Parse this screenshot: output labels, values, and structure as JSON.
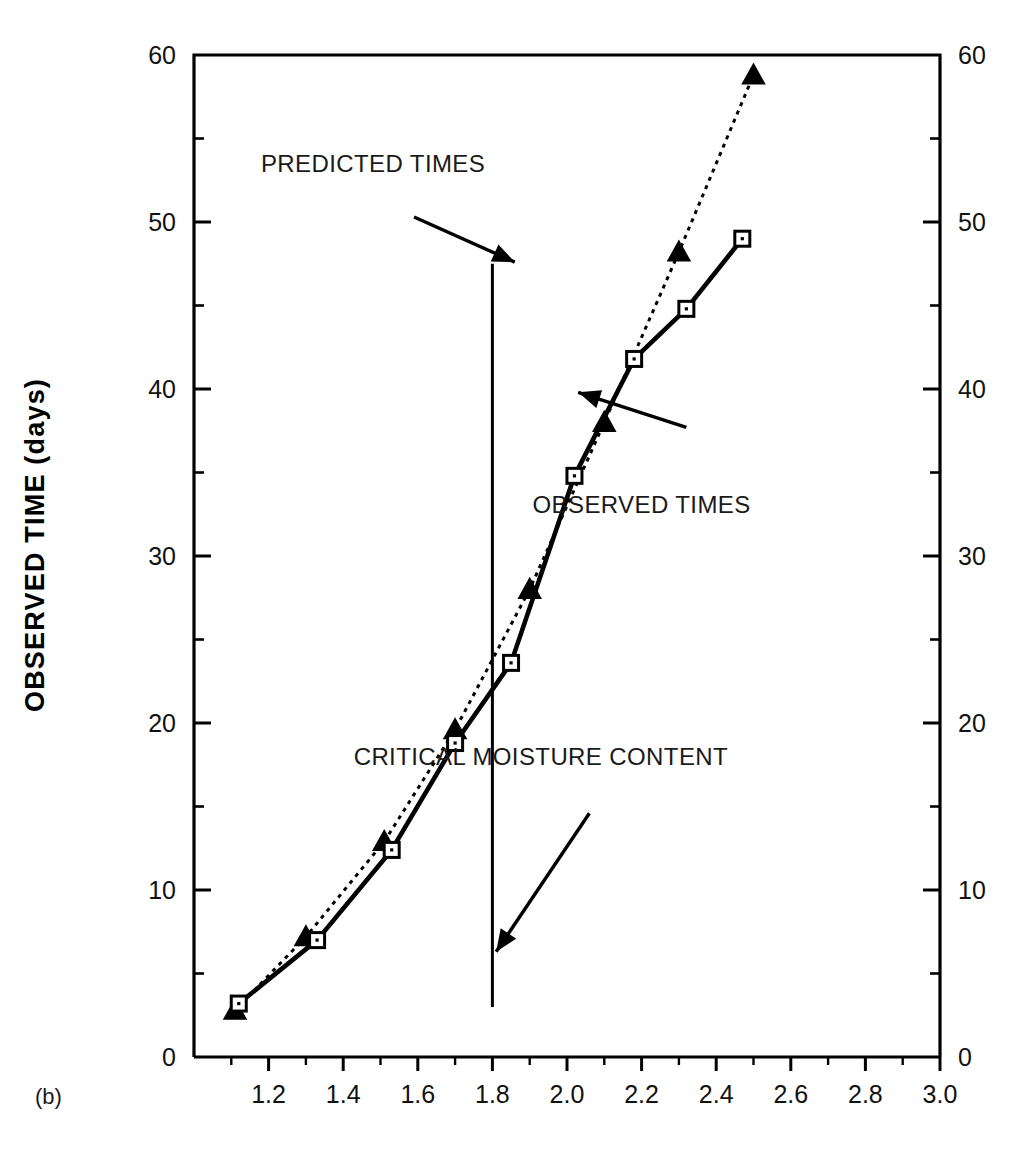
{
  "figure": {
    "panel_label": "(b)",
    "background_color": "#ffffff",
    "ink_color": "#000000"
  },
  "chart_data": {
    "type": "line",
    "title": "",
    "xlabel": "",
    "ylabel": "OBSERVED TIME (days)",
    "xlim": [
      1.0,
      3.0
    ],
    "ylim": [
      0,
      60
    ],
    "x_major_ticks": [
      1.2,
      1.4,
      1.6,
      1.8,
      2.0,
      2.2,
      2.4,
      2.6,
      2.8,
      3.0
    ],
    "x_major_tick_labels": [
      "1.2",
      "1.4",
      "1.6",
      "1.8",
      "2.0",
      "2.2",
      "2.4",
      "2.6",
      "2.8",
      "3.0"
    ],
    "x_minor_ticks": [
      1.1,
      1.3,
      1.5,
      1.7,
      1.9,
      2.1,
      2.3,
      2.5,
      2.7,
      2.9
    ],
    "y_major_ticks": [
      0,
      10,
      20,
      30,
      40,
      50,
      60
    ],
    "y_major_tick_labels": [
      "0",
      "10",
      "20",
      "30",
      "40",
      "50",
      "60"
    ],
    "y_minor_ticks": [
      5,
      15,
      25,
      35,
      45,
      55
    ],
    "grid": false,
    "legend_position": "none",
    "left_axis_labels": [
      "60",
      "50",
      "40",
      "30",
      "20",
      "10",
      "0"
    ],
    "right_axis_labels": [
      "60",
      "50",
      "40",
      "30",
      "20",
      "10",
      "0"
    ],
    "series": [
      {
        "name": "PREDICTED TIMES",
        "marker": "filled-triangle",
        "linestyle": "dotted",
        "color": "#000000",
        "points": [
          {
            "x": 1.11,
            "y": 2.8
          },
          {
            "x": 1.3,
            "y": 7.2
          },
          {
            "x": 1.51,
            "y": 12.9
          },
          {
            "x": 1.7,
            "y": 19.6
          },
          {
            "x": 1.9,
            "y": 28.0
          },
          {
            "x": 2.1,
            "y": 38.0
          },
          {
            "x": 2.3,
            "y": 48.2
          },
          {
            "x": 2.5,
            "y": 58.8
          }
        ]
      },
      {
        "name": "OBSERVED TIMES",
        "marker": "open-square",
        "linestyle": "solid",
        "color": "#000000",
        "points": [
          {
            "x": 1.12,
            "y": 3.2
          },
          {
            "x": 1.33,
            "y": 7.0
          },
          {
            "x": 1.53,
            "y": 12.4
          },
          {
            "x": 1.7,
            "y": 18.8
          },
          {
            "x": 1.85,
            "y": 23.6
          },
          {
            "x": 2.02,
            "y": 34.8
          },
          {
            "x": 2.18,
            "y": 41.8
          },
          {
            "x": 2.32,
            "y": 44.8
          },
          {
            "x": 2.47,
            "y": 49.0
          }
        ]
      }
    ],
    "reference_lines": [
      {
        "name": "CRITICAL MOISTURE CONTENT",
        "orientation": "vertical",
        "x": 1.8,
        "y_from": 3.0,
        "y_to": 47.5
      }
    ],
    "annotations": [
      {
        "text": "PREDICTED TIMES",
        "label_x": 1.48,
        "label_y": 53.0,
        "arrow_from": {
          "x": 1.59,
          "y": 50.3
        },
        "arrow_to": {
          "x": 1.86,
          "y": 47.6
        }
      },
      {
        "text": "OBSERVED TIMES",
        "label_x": 2.2,
        "label_y": 32.6,
        "arrow_from": {
          "x": 2.32,
          "y": 37.7
        },
        "arrow_to": {
          "x": 2.03,
          "y": 39.8
        }
      },
      {
        "text": "CRITICAL MOISTURE CONTENT",
        "label_x": 1.93,
        "label_y": 17.5,
        "arrow_from": {
          "x": 2.06,
          "y": 14.6
        },
        "arrow_to": {
          "x": 1.81,
          "y": 6.3
        }
      }
    ]
  }
}
